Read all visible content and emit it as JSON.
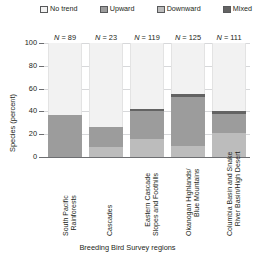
{
  "chart_data": {
    "type": "bar",
    "subtype": "stacked-percent",
    "title": "",
    "xlabel": "Breeding Bird Survey regions",
    "ylabel": "Species (percent)",
    "ylim": [
      0,
      100
    ],
    "yticks": [
      0,
      20,
      40,
      60,
      80,
      100
    ],
    "grid": true,
    "legend_position": "top",
    "categories": [
      "South Pacific Rainforests",
      "Cascades",
      "Eastern Cascade Slopes and Foothills",
      "Okanogan Highlands/ Blue Mountains",
      "Columbia Basin and Snake River Basin/High Desert"
    ],
    "category_lines": [
      [
        "South Pacific",
        "Rainforests"
      ],
      [
        "Cascades"
      ],
      [
        "Eastern Cascade",
        "Slopes and Foothills"
      ],
      [
        "Okanogan Highlands/",
        "Blue Mountains"
      ],
      [
        "Columbia Basin and Snake",
        "River Basin/High Desert"
      ]
    ],
    "series": [
      {
        "name": "Downward",
        "color": "#bcbcbc",
        "values": [
          0,
          9,
          16,
          10,
          21
        ]
      },
      {
        "name": "Upward",
        "color": "#9c9c9c",
        "values": [
          37,
          17,
          24,
          43,
          17
        ]
      },
      {
        "name": "Mixed",
        "color": "#636363",
        "values": [
          0,
          0,
          2,
          2,
          2
        ]
      },
      {
        "name": "No trend",
        "color": "#f2f2f2",
        "values": [
          63,
          74,
          58,
          45,
          60
        ]
      }
    ],
    "annotations": [
      {
        "text": "N = 89",
        "n": 89,
        "category": "South Pacific Rainforests"
      },
      {
        "text": "N = 23",
        "n": 23,
        "category": "Cascades"
      },
      {
        "text": "N = 119",
        "n": 119,
        "category": "Eastern Cascade Slopes and Foothills"
      },
      {
        "text": "N = 125",
        "n": 125,
        "category": "Okanogan Highlands/ Blue Mountains"
      },
      {
        "text": "N = 111",
        "n": 111,
        "category": "Columbia Basin and Snake River Basin/High Desert"
      }
    ]
  },
  "legend": {
    "items": [
      {
        "label": "No trend",
        "color": "#f2f2f2"
      },
      {
        "label": "Upward",
        "color": "#9c9c9c"
      },
      {
        "label": "Downward",
        "color": "#bcbcbc"
      },
      {
        "label": "Mixed",
        "color": "#636363"
      }
    ]
  },
  "yaxis": {
    "title": "Species (percent)",
    "ticks": [
      "0",
      "20",
      "40",
      "60",
      "80",
      "100"
    ]
  },
  "xaxis": {
    "title": "Breeding Bird Survey regions"
  },
  "nlabels": {
    "b0": "N = 89",
    "b1": "N = 23",
    "b2": "N = 119",
    "b3": "N = 125",
    "b4": "N = 111"
  },
  "xlabels": {
    "b0l0": "South Pacific",
    "b0l1": "Rainforests",
    "b1l0": "Cascades",
    "b1l1": "",
    "b2l0": "Eastern Cascade",
    "b2l1": "Slopes and Foothills",
    "b3l0": "Okanogan Highlands/",
    "b3l1": "Blue Mountains",
    "b4l0": "Columbia Basin and Snake",
    "b4l1": "River Basin/High Desert"
  }
}
